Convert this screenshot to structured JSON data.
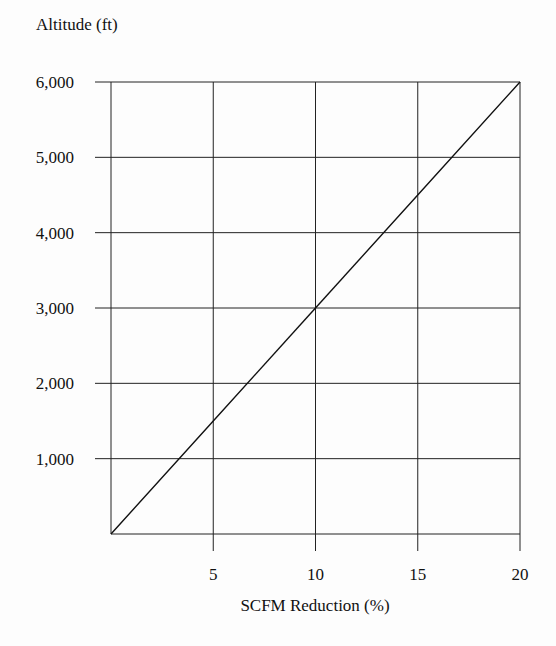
{
  "chart_data": {
    "type": "line",
    "title": "",
    "xlabel": "SCFM Reduction (%)",
    "ylabel": "Altitude (ft)",
    "xlim": [
      0,
      20
    ],
    "ylim": [
      0,
      6000
    ],
    "x_ticks": [
      5,
      10,
      15,
      20
    ],
    "x_tick_labels": [
      "5",
      "10",
      "15",
      "20"
    ],
    "y_ticks": [
      1000,
      2000,
      3000,
      4000,
      5000,
      6000
    ],
    "y_tick_labels": [
      "1,000",
      "2,000",
      "3,000",
      "4,000",
      "5,000",
      "6,000"
    ],
    "grid": true,
    "legend": null,
    "series": [
      {
        "name": "Altitude vs SCFM Reduction",
        "x": [
          0,
          5,
          10,
          15,
          20
        ],
        "y": [
          0,
          1500,
          3000,
          4500,
          6000
        ]
      }
    ],
    "line_color": "#111111"
  }
}
